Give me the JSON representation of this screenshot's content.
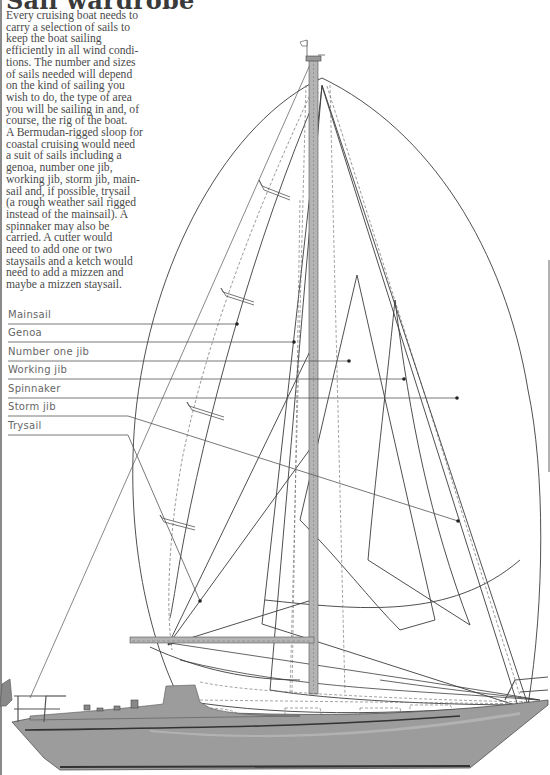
{
  "title": "Sail wardrobe",
  "body_lines": [
    "Every cruising boat needs to",
    "carry a selection of sails to",
    "keep the boat sailing",
    "efficiently in all wind condi-",
    "tions. The number and sizes",
    "of sails needed will depend",
    "on the kind of sailing you",
    "wish to do, the type of area",
    "you will be sailing in and, of",
    "course, the rig of the boat.",
    "A Bermudan-rigged sloop for",
    "coastal cruising would need",
    "a suit of sails including a",
    "genoa, number one jib,",
    "working jib, storm jib, main-",
    "sail and, if possible, trysail",
    "(a rough weather sail rigged",
    "instead of the mainsail). A",
    "spinnaker may also be",
    "carried. A cutter would",
    "need to add one or two",
    "staysails and a ketch would",
    "need to add a mizzen and",
    "maybe a mizzen staysail."
  ],
  "legend": [
    {
      "label": "Mainsail",
      "y": 322,
      "leader_end_x": 237,
      "leader_end_y": 324
    },
    {
      "label": "Genoa",
      "y": 341,
      "leader_end_x": 294,
      "leader_end_y": 342
    },
    {
      "label": "Number one jib",
      "y": 360,
      "leader_end_x": 349,
      "leader_end_y": 361
    },
    {
      "label": "Working jib",
      "y": 378,
      "leader_end_x": 404,
      "leader_end_y": 379
    },
    {
      "label": "Spinnaker",
      "y": 397,
      "leader_end_x": 457,
      "leader_end_y": 398
    },
    {
      "label": "Storm jib",
      "y": 415,
      "leader_end_x": 458,
      "leader_end_y": 521
    },
    {
      "label": "Trysail",
      "y": 434,
      "leader_end_x": 200,
      "leader_end_y": 601
    }
  ],
  "colors": {
    "text": "#4a4a4a",
    "line": "#3c3c3c",
    "hull": "#9c9c9c",
    "mast": "#b4b4b4",
    "leader": "#555555"
  }
}
